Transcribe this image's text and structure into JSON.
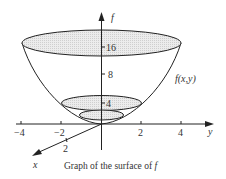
{
  "diagram": {
    "title": "Graph of the surface of f",
    "caption_prefix": "Graph of the surface of ",
    "caption_var": "f",
    "axes": {
      "vertical": {
        "label": "f",
        "ticks": [
          "16",
          "8",
          "4"
        ]
      },
      "horizontal": {
        "label": "y",
        "ticks": [
          "−4",
          "−2",
          "2",
          "4"
        ]
      },
      "depth": {
        "label": "x",
        "ticks": [
          "2"
        ]
      }
    },
    "surface_label": "f(x,y)",
    "level_curves": [
      {
        "level": "16",
        "fill": "#e4e4e4"
      },
      {
        "level": "4",
        "fill": "#e0e0e0"
      },
      {
        "level": "1",
        "fill": "#e6e6e6"
      }
    ],
    "colors": {
      "line": "#222222",
      "fill": "#e2e2e2"
    }
  }
}
